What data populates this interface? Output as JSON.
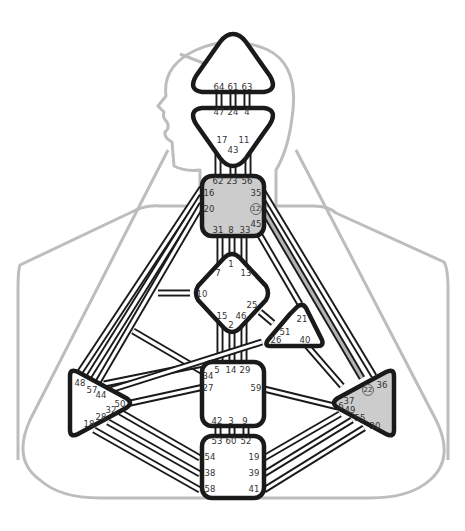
{
  "caption": {
    "text": "· ·· ···· ·· ·· ··",
    "note": "cropped, illegible"
  },
  "colors": {
    "outline": "#bdbdbd",
    "stroke": "#1a1a1a",
    "defined_fill": "#cccccc",
    "open_fill": "#ffffff",
    "active_channel": "#b3b3b3"
  },
  "centers": {
    "head": {
      "name": "Head",
      "defined": false,
      "gates": [
        "64",
        "61",
        "63"
      ]
    },
    "ajna": {
      "name": "Ajna",
      "defined": false,
      "gates": [
        "47",
        "24",
        "4",
        "17",
        "11",
        "43"
      ]
    },
    "throat": {
      "name": "Throat",
      "defined": true,
      "gates": [
        "62",
        "23",
        "56",
        "16",
        "35",
        "20",
        "12",
        "45",
        "31",
        "8",
        "33"
      ],
      "highlighted_gates": [
        "12"
      ]
    },
    "g": {
      "name": "G",
      "defined": false,
      "gates": [
        "1",
        "7",
        "13",
        "10",
        "25",
        "15",
        "46",
        "2"
      ]
    },
    "ego": {
      "name": "Heart",
      "defined": false,
      "gates": [
        "21",
        "51",
        "26",
        "40"
      ]
    },
    "sacral": {
      "name": "Sacral",
      "defined": false,
      "gates": [
        "5",
        "14",
        "29",
        "34",
        "27",
        "59",
        "42",
        "3",
        "9"
      ]
    },
    "root": {
      "name": "Root",
      "defined": false,
      "gates": [
        "53",
        "60",
        "52",
        "54",
        "19",
        "38",
        "39",
        "58",
        "41"
      ]
    },
    "spleen": {
      "name": "Spleen",
      "defined": false,
      "gates": [
        "48",
        "57",
        "44",
        "50",
        "32",
        "28",
        "18"
      ]
    },
    "solar_plexus": {
      "name": "Solar Plexus",
      "defined": true,
      "gates": [
        "36",
        "22",
        "37",
        "6",
        "49",
        "55",
        "30"
      ],
      "highlighted_gates": [
        "22"
      ]
    }
  },
  "channels": {
    "active": [
      "12-22"
    ]
  }
}
